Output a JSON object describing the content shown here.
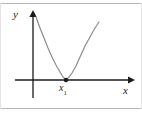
{
  "figure": {
    "name": "parabola-tangent-to-x-axis",
    "background_color": "#ffffff",
    "frame": {
      "top_rule_color": "#b8b8b8",
      "bottom_rule_color": "#b8b8b8",
      "side_edge_color": "#e4e4e4"
    },
    "axes": {
      "x_label": "x",
      "y_label": "y",
      "axis_color": "#1a1a1a",
      "x_axis_y_px": 80,
      "y_axis_x_px": 33,
      "x_axis_start_px": 15,
      "x_axis_end_px": 132,
      "y_axis_top_px": 12,
      "y_axis_bottom_px": 98,
      "arrowheads": [
        "x-axis-right",
        "y-axis-up"
      ]
    },
    "point": {
      "label": "x",
      "subscript": "1",
      "marker_color": "#1a1a1a",
      "marker_radius_px": 2.2,
      "x_px": 66,
      "y_px": 80
    }
  },
  "chart_data": {
    "type": "line",
    "title": "",
    "subtitle": "",
    "xlabel": "x",
    "ylabel": "y",
    "grid": false,
    "legend": null,
    "annotations": [
      {
        "text": "x₁",
        "x_px": 66,
        "y_px": 88,
        "role": "root-label"
      }
    ],
    "series": [
      {
        "name": "parabola",
        "description": "Upward-opening parabola tangent to the x-axis (double root) at x₁",
        "color": "#8c8c8c",
        "line_width_px": 1.2,
        "vertex_px": {
          "x": 66,
          "y": 80
        },
        "points_px": [
          {
            "x": 36,
            "y": 17
          },
          {
            "x": 40,
            "y": 28
          },
          {
            "x": 44,
            "y": 38
          },
          {
            "x": 48,
            "y": 48
          },
          {
            "x": 52,
            "y": 57
          },
          {
            "x": 56,
            "y": 65
          },
          {
            "x": 60,
            "y": 72
          },
          {
            "x": 63,
            "y": 77
          },
          {
            "x": 66,
            "y": 80
          },
          {
            "x": 69,
            "y": 77
          },
          {
            "x": 72,
            "y": 73
          },
          {
            "x": 76,
            "y": 66
          },
          {
            "x": 80,
            "y": 57
          },
          {
            "x": 85,
            "y": 46
          },
          {
            "x": 90,
            "y": 37
          },
          {
            "x": 95,
            "y": 28
          },
          {
            "x": 99,
            "y": 22
          }
        ]
      }
    ],
    "axis_ranges": {
      "x_px": [
        15,
        132
      ],
      "y_px": [
        12,
        98
      ]
    }
  }
}
